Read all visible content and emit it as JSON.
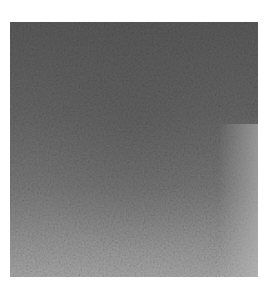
{
  "image": {
    "description": "Grayscale noisy surface texture, darker at top and lighter toward bottom and lower-right",
    "colors": {
      "background": "#ffffff",
      "dark_tone": "#5a5a5a",
      "mid_tone": "#777777",
      "light_tone": "#a8a8a8"
    }
  }
}
